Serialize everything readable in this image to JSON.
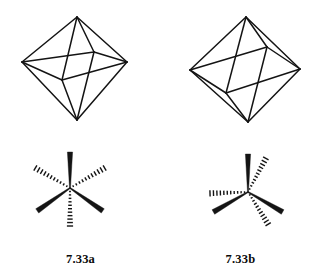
{
  "figure": {
    "background_color": "#ffffff",
    "ink_color": "#141414",
    "panels": [
      {
        "id": "a",
        "caption": "7.33a",
        "polyhedron": {
          "name": "octahedron-wireframe-front-view",
          "description": "Octahedron drawn in wireframe with visible equatorial square and all edges shown",
          "vertices": {
            "top": [
              77,
              17
            ],
            "bottom": [
              77,
              120
            ],
            "left": [
              22,
              62
            ],
            "right": [
              127,
              62
            ],
            "front": [
              62,
              80
            ],
            "back": [
              94,
              52
            ]
          },
          "edges": [
            [
              "top",
              "left"
            ],
            [
              "top",
              "right"
            ],
            [
              "top",
              "front"
            ],
            [
              "top",
              "back"
            ],
            [
              "bottom",
              "left"
            ],
            [
              "bottom",
              "right"
            ],
            [
              "bottom",
              "front"
            ],
            [
              "bottom",
              "back"
            ],
            [
              "left",
              "front"
            ],
            [
              "front",
              "right"
            ],
            [
              "right",
              "back"
            ],
            [
              "back",
              "left"
            ]
          ]
        },
        "stereo_center": {
          "name": "six-coordinate-stereocenter-all-trans",
          "center": [
            70,
            188
          ],
          "bonds": [
            {
              "type": "wedge",
              "angle_deg": 90,
              "length": 36,
              "label": "solid-wedge-up"
            },
            {
              "type": "wedge",
              "angle_deg": 215,
              "length": 40,
              "label": "solid-wedge-lower-left"
            },
            {
              "type": "wedge",
              "angle_deg": 325,
              "length": 40,
              "label": "solid-wedge-lower-right"
            },
            {
              "type": "hash",
              "angle_deg": 150,
              "length": 40,
              "label": "hashed-wedge-upper-left"
            },
            {
              "type": "hash",
              "angle_deg": 30,
              "length": 40,
              "label": "hashed-wedge-upper-right"
            },
            {
              "type": "hash",
              "angle_deg": 270,
              "length": 38,
              "label": "hashed-wedge-down"
            }
          ]
        }
      },
      {
        "id": "b",
        "caption": "7.33b",
        "polyhedron": {
          "name": "octahedron-wireframe-rotated-view",
          "description": "Octahedron rotated so two rhombic faces dominate the silhouette",
          "vertices": {
            "top": [
              246,
              17
            ],
            "bottom": [
              248,
              122
            ],
            "left": [
              190,
              70
            ],
            "right": [
              300,
              69
            ],
            "front": [
              226,
              93
            ],
            "back": [
              267,
              47
            ]
          },
          "edges": [
            [
              "top",
              "left"
            ],
            [
              "top",
              "right"
            ],
            [
              "top",
              "back"
            ],
            [
              "top",
              "front"
            ],
            [
              "bottom",
              "left"
            ],
            [
              "bottom",
              "right"
            ],
            [
              "bottom",
              "front"
            ],
            [
              "bottom",
              "back"
            ],
            [
              "left",
              "front"
            ],
            [
              "front",
              "right"
            ],
            [
              "right",
              "back"
            ],
            [
              "back",
              "left"
            ]
          ]
        },
        "stereo_center": {
          "name": "six-coordinate-stereocenter-paired",
          "center": [
            248,
            192
          ],
          "bonds": [
            {
              "type": "wedge",
              "angle_deg": 90,
              "length": 38,
              "label": "solid-wedge-up"
            },
            {
              "type": "wedge",
              "angle_deg": 210,
              "length": 40,
              "label": "solid-wedge-lower-left"
            },
            {
              "type": "wedge",
              "angle_deg": 330,
              "length": 40,
              "label": "solid-wedge-lower-right"
            },
            {
              "type": "hash",
              "angle_deg": 62,
              "length": 38,
              "label": "hashed-wedge-upper-right"
            },
            {
              "type": "hash",
              "angle_deg": 182,
              "length": 38,
              "label": "hashed-wedge-left"
            },
            {
              "type": "hash",
              "angle_deg": 302,
              "length": 38,
              "label": "hashed-wedge-lower-right"
            }
          ]
        }
      }
    ]
  }
}
